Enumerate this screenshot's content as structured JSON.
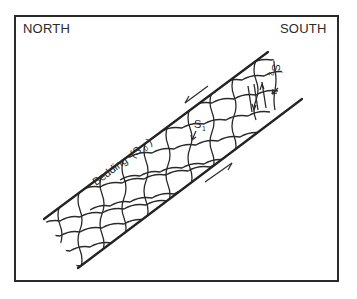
{
  "diagram": {
    "orientation_labels": {
      "left": "NORTH",
      "right": "SOUTH"
    },
    "annotations": {
      "bedding": "Bedding",
      "bedding_symbol": "(S",
      "bedding_sub": "0",
      "bedding_close": ")",
      "s1": "S",
      "s1_sub": "1",
      "s2": "S",
      "s2_sub": "2"
    },
    "colors": {
      "ink": "#2a2a2a",
      "background": "#ffffff"
    }
  }
}
